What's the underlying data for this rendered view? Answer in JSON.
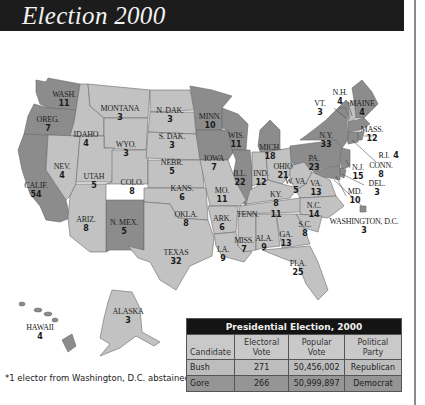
{
  "header": {
    "title": "Election 2000"
  },
  "colors": {
    "republican": "#c2c2c2",
    "democrat": "#8c8c8c",
    "header_bg": "#1c1c1c"
  },
  "states": {
    "wash": {
      "name": "WASH.",
      "votes": "11"
    },
    "oreg": {
      "name": "OREG.",
      "votes": "7"
    },
    "calif": {
      "name": "CALIF.",
      "votes": "54"
    },
    "idaho": {
      "name": "IDAHO",
      "votes": "4"
    },
    "nev": {
      "name": "NEV.",
      "votes": "4"
    },
    "montana": {
      "name": "MONTANA",
      "votes": "3"
    },
    "wyo": {
      "name": "WYO.",
      "votes": "3"
    },
    "utah": {
      "name": "UTAH",
      "votes": "5"
    },
    "ariz": {
      "name": "ARIZ.",
      "votes": "8"
    },
    "colo": {
      "name": "COLO.",
      "votes": "8"
    },
    "nmex": {
      "name": "N. MEX.",
      "votes": "5"
    },
    "ndak": {
      "name": "N. DAK.",
      "votes": "3"
    },
    "sdak": {
      "name": "S. DAK.",
      "votes": "3"
    },
    "nebr": {
      "name": "NEBR.",
      "votes": "5"
    },
    "kans": {
      "name": "KANS.",
      "votes": "6"
    },
    "okla": {
      "name": "OKLA.",
      "votes": "8"
    },
    "texas": {
      "name": "TEXAS",
      "votes": "32"
    },
    "minn": {
      "name": "MINN.",
      "votes": "10"
    },
    "iowa": {
      "name": "IOWA",
      "votes": "7"
    },
    "mo": {
      "name": "MO.",
      "votes": "11"
    },
    "ark": {
      "name": "ARK.",
      "votes": "6"
    },
    "la": {
      "name": "LA.",
      "votes": "9"
    },
    "wis": {
      "name": "WIS.",
      "votes": "11"
    },
    "ill": {
      "name": "ILL.",
      "votes": "22"
    },
    "mich": {
      "name": "MICH.",
      "votes": "18"
    },
    "ind": {
      "name": "IND.",
      "votes": "12"
    },
    "ohio": {
      "name": "OHIO",
      "votes": "21"
    },
    "ky": {
      "name": "KY.",
      "votes": "8"
    },
    "tenn": {
      "name": "TENN.",
      "votes": "11"
    },
    "miss": {
      "name": "MISS.",
      "votes": "7"
    },
    "ala": {
      "name": "ALA.",
      "votes": "9"
    },
    "ga": {
      "name": "GA.",
      "votes": "13"
    },
    "fla": {
      "name": "FLA.",
      "votes": "25"
    },
    "sc": {
      "name": "S.C.",
      "votes": "8"
    },
    "nc": {
      "name": "N.C.",
      "votes": "14"
    },
    "va": {
      "name": "VA.",
      "votes": "13"
    },
    "wva": {
      "name": "W. VA.",
      "votes": "5"
    },
    "pa": {
      "name": "PA.",
      "votes": "23"
    },
    "ny": {
      "name": "N.Y.",
      "votes": "33"
    },
    "vt": {
      "name": "VT.",
      "votes": "3"
    },
    "nh": {
      "name": "N.H.",
      "votes": "4"
    },
    "maine": {
      "name": "MAINE",
      "votes": "4"
    },
    "mass": {
      "name": "MASS.",
      "votes": "12"
    },
    "ri": {
      "name": "R.I.",
      "votes": "4"
    },
    "conn": {
      "name": "CONN.",
      "votes": "8"
    },
    "nj": {
      "name": "N.J.",
      "votes": "15"
    },
    "del": {
      "name": "DEL.",
      "votes": "3"
    },
    "md": {
      "name": "MD.",
      "votes": "10"
    },
    "dc": {
      "name": "WASHINGTON, D.C.",
      "votes": "3"
    },
    "alaska": {
      "name": "ALASKA",
      "votes": "3"
    },
    "hawaii": {
      "name": "HAWAII",
      "votes": "4"
    }
  },
  "footnote": "*1 elector from Washington, D.C. abstained",
  "table": {
    "caption": "Presidential Election, 2000",
    "headers": {
      "candidate": "Candidate",
      "electoral": "Electoral Vote",
      "popular": "Popular Vote",
      "party": "Political Party"
    },
    "rows": [
      {
        "candidate": "Bush",
        "electoral": "271",
        "popular": "50,456,002",
        "party": "Republican"
      },
      {
        "candidate": "Gore",
        "electoral": "266",
        "popular": "50,999,897",
        "party": "Democrat"
      }
    ]
  }
}
